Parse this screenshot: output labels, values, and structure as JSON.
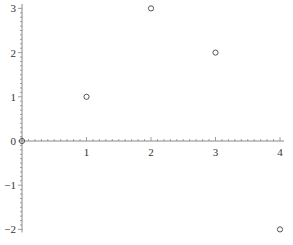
{
  "chart_data": {
    "type": "scatter",
    "title": "",
    "xlabel": "",
    "ylabel": "",
    "xlim": [
      0,
      4
    ],
    "ylim": [
      -2,
      3
    ],
    "grid": false,
    "legend": null,
    "x_ticks": [
      "0",
      "1",
      "2",
      "3",
      "4"
    ],
    "y_ticks": [
      "3",
      "2",
      "1",
      "0",
      "−1",
      "−2"
    ],
    "series": [
      {
        "name": "points",
        "marker": "open-circle",
        "color": "#555555",
        "points": [
          {
            "x": 0,
            "y": 0
          },
          {
            "x": 1,
            "y": 1
          },
          {
            "x": 2,
            "y": 3
          },
          {
            "x": 3,
            "y": 2
          },
          {
            "x": 4,
            "y": -2
          }
        ]
      }
    ]
  },
  "colors": {
    "axis": "#888888",
    "marker": "#555555",
    "text": "#333333"
  }
}
